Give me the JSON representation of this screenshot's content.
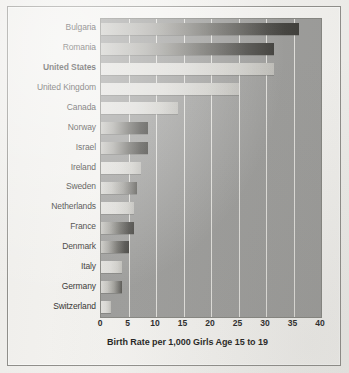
{
  "figure": {
    "background_color": "#f2f1ee",
    "frame_color": "#8e8d89",
    "plot_background_color": "#9b9b99",
    "gridline_color": "#e8e7e3"
  },
  "chart_data": {
    "type": "bar",
    "orientation": "horizontal",
    "title": "",
    "xlabel": "Birth Rate per 1,000 Girls Age 15 to 19",
    "ylabel": "",
    "xlim": [
      0,
      40
    ],
    "xticks": [
      0,
      5,
      10,
      15,
      20,
      25,
      30,
      35,
      40
    ],
    "xtick_labels": [
      "0",
      "5",
      "10",
      "15",
      "20",
      "25",
      "30",
      "35",
      "40"
    ],
    "grid": true,
    "grid_axis": "x",
    "legend": false,
    "highlighted_category": "United States",
    "categories": [
      "Bulgaria",
      "Romania",
      "United States",
      "United Kingdom",
      "Canada",
      "Norway",
      "Israel",
      "Ireland",
      "Sweden",
      "Netherlands",
      "France",
      "Denmark",
      "Italy",
      "Germany",
      "Switzerland"
    ],
    "values": [
      36,
      31.5,
      31.5,
      25,
      14,
      8.5,
      8.5,
      7.3,
      6.5,
      6,
      6,
      5,
      3.8,
      3.8,
      1.8
    ],
    "bars": [
      {
        "label": "Bulgaria",
        "value": 36,
        "shade": "dark",
        "bold": false
      },
      {
        "label": "Romania",
        "value": 31.5,
        "shade": "dark",
        "bold": false
      },
      {
        "label": "United States",
        "value": 31.5,
        "shade": "light",
        "bold": true
      },
      {
        "label": "United Kingdom",
        "value": 25,
        "shade": "light",
        "bold": false
      },
      {
        "label": "Canada",
        "value": 14,
        "shade": "light",
        "bold": false
      },
      {
        "label": "Norway",
        "value": 8.5,
        "shade": "dark",
        "bold": false
      },
      {
        "label": "Israel",
        "value": 8.5,
        "shade": "dark",
        "bold": false
      },
      {
        "label": "Ireland",
        "value": 7.3,
        "shade": "light",
        "bold": false
      },
      {
        "label": "Sweden",
        "value": 6.5,
        "shade": "default",
        "bold": false
      },
      {
        "label": "Netherlands",
        "value": 6,
        "shade": "light",
        "bold": false
      },
      {
        "label": "France",
        "value": 6,
        "shade": "dark",
        "bold": false
      },
      {
        "label": "Denmark",
        "value": 5,
        "shade": "dark",
        "bold": false
      },
      {
        "label": "Italy",
        "value": 3.8,
        "shade": "light",
        "bold": false
      },
      {
        "label": "Germany",
        "value": 3.8,
        "shade": "default",
        "bold": false
      },
      {
        "label": "Switzerland",
        "value": 1.8,
        "shade": "light",
        "bold": false
      }
    ]
  }
}
